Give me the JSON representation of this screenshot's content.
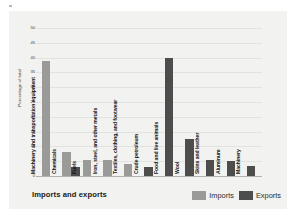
{
  "figure": {
    "caption": "Imports and exports"
  },
  "legend": {
    "items": [
      {
        "label": "Imports",
        "color": "#9a9a98",
        "swatch_name": "legend-swatch-imports"
      },
      {
        "label": "Exports",
        "color": "#4d4d4d",
        "swatch_name": "legend-swatch-exports"
      }
    ]
  },
  "chart_data": {
    "type": "bar",
    "title": "Imports and exports",
    "xlabel": "",
    "ylabel": "Percentage of total",
    "ylim": [
      0,
      50
    ],
    "yticks": [
      0,
      5,
      10,
      15,
      20,
      25,
      30,
      35,
      40,
      45,
      50
    ],
    "grid": true,
    "legend_position": "bottom-right",
    "categories": [
      "Machinery and transportation equipment",
      "Chemicals",
      "Fuels",
      "Iron, steel, and other metals",
      "Textiles, clothing, and footwear",
      "Crude petroleum",
      "Food and live animals",
      "Wool",
      "Skins and leather",
      "Aluminum",
      "Machinery"
    ],
    "series": [
      {
        "name": "Imports",
        "color": "#9a9a98",
        "values": [
          39,
          8,
          0,
          5.5,
          5.5,
          4,
          3,
          0,
          0,
          0,
          0
        ]
      },
      {
        "name": "Exports",
        "color": "#4d4d4d",
        "values": [
          0,
          3,
          0,
          0,
          0,
          3,
          40,
          12.5,
          5.5,
          5,
          3.5
        ]
      }
    ],
    "bars": [
      {
        "category": "Machinery and transportation equipment",
        "series": "Imports",
        "value": 39
      },
      {
        "category": "Chemicals",
        "series": "Imports",
        "value": 8
      },
      {
        "category": "Chemicals",
        "series": "Exports",
        "value": 3
      },
      {
        "category": "Fuels",
        "series": "Imports",
        "value": 5.5
      },
      {
        "category": "Iron, steel, and other metals",
        "series": "Imports",
        "value": 5.5
      },
      {
        "category": "Textiles, clothing, and footwear",
        "series": "Imports",
        "value": 4
      },
      {
        "category": "Crude petroleum",
        "series": "Exports",
        "value": 3
      },
      {
        "category": "Food and live animals",
        "series": "Exports",
        "value": 40
      },
      {
        "category": "Wool",
        "series": "Exports",
        "value": 12.5
      },
      {
        "category": "Skins and leather",
        "series": "Exports",
        "value": 5.5
      },
      {
        "category": "Aluminum",
        "series": "Exports",
        "value": 5
      },
      {
        "category": "Machinery",
        "series": "Exports",
        "value": 3.5
      }
    ]
  },
  "axis": {
    "y_title": "Percentage of total",
    "ticks": [
      "50",
      "45",
      "40",
      "35",
      "30",
      "25",
      "20",
      "15",
      "10",
      "5",
      "0"
    ]
  }
}
